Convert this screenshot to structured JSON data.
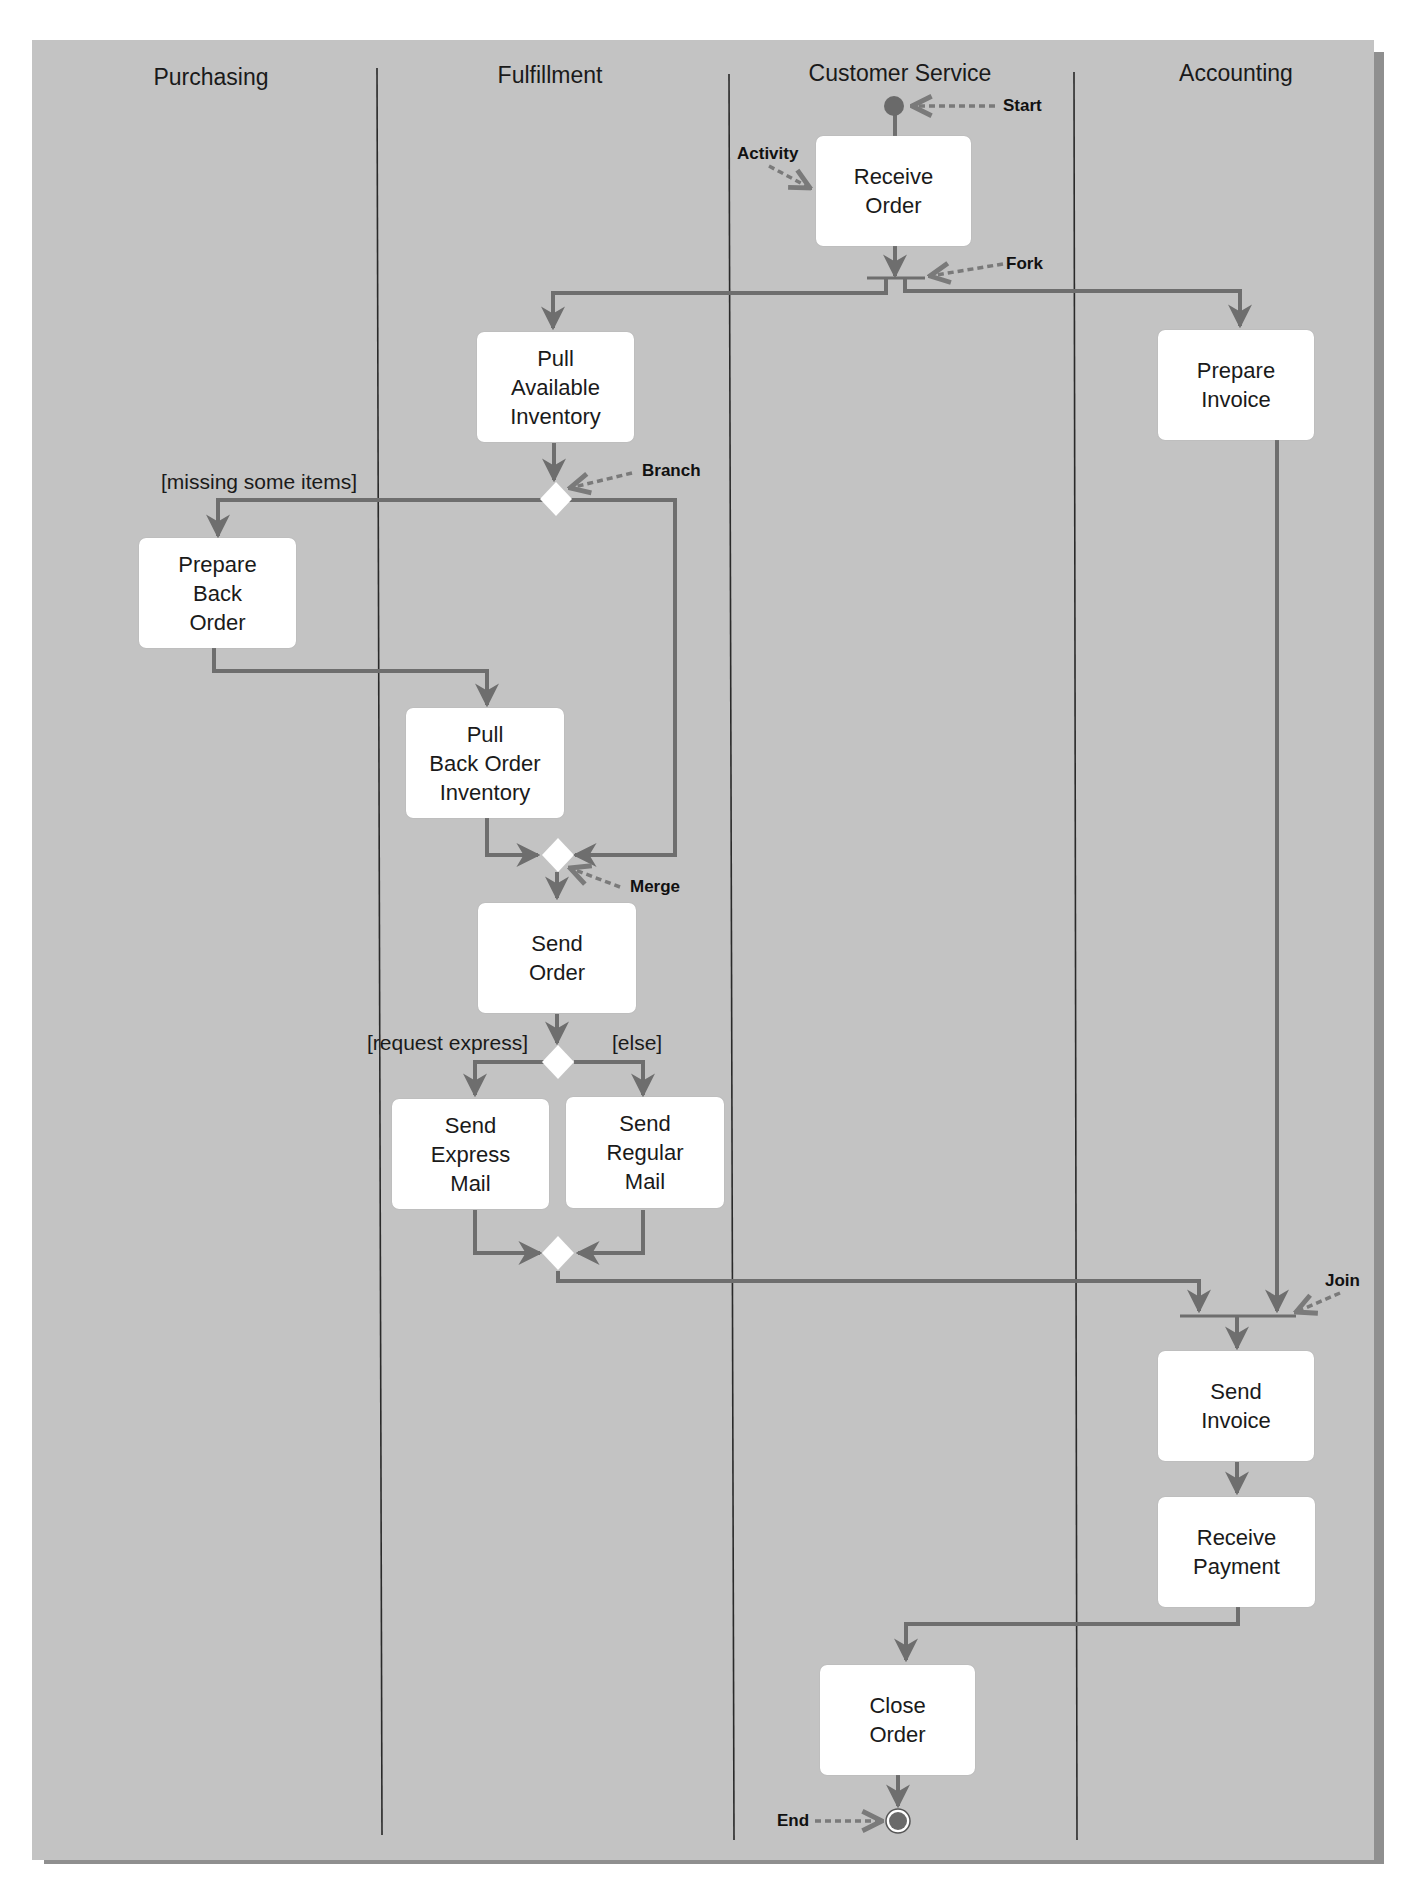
{
  "lanes": [
    {
      "id": "purchasing",
      "label": "Purchasing"
    },
    {
      "id": "fulfillment",
      "label": "Fulfillment"
    },
    {
      "id": "customer_service",
      "label": "Customer Service"
    },
    {
      "id": "accounting",
      "label": "Accounting"
    }
  ],
  "activities": {
    "receive_order": "Receive\nOrder",
    "pull_available_inventory": "Pull\nAvailable\nInventory",
    "prepare_invoice": "Prepare\nInvoice",
    "prepare_back_order": "Prepare\nBack\nOrder",
    "pull_back_order_inventory": "Pull\nBack Order\nInventory",
    "send_order": "Send\nOrder",
    "send_express_mail": "Send\nExpress\nMail",
    "send_regular_mail": "Send\nRegular\nMail",
    "send_invoice": "Send\nInvoice",
    "receive_payment": "Receive\nPayment",
    "close_order": "Close\nOrder"
  },
  "guards": {
    "missing_items": "[missing some items]",
    "request_express": "[request express]",
    "else": "[else]"
  },
  "callouts": {
    "start": "Start",
    "activity": "Activity",
    "fork": "Fork",
    "branch": "Branch",
    "merge": "Merge",
    "join": "Join",
    "end": "End"
  },
  "colors": {
    "background": "#c3c3c3",
    "flow_line": "#6e6e6e",
    "callout_dots": "#7a7a7a",
    "activity_fill": "#ffffff",
    "lane_divider": "#2a2a2a"
  }
}
